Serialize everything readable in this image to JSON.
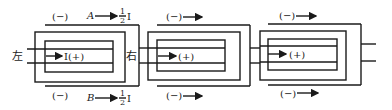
{
  "diagram": {
    "type": "current-flow-schematic",
    "units": 3,
    "labels": {
      "left": "左",
      "right": "右",
      "inner_current": "I(+)",
      "inner_sign": "(+)",
      "outer_sign": "(−)",
      "top_branch": "A",
      "bottom_branch": "B",
      "half_current_num": "1",
      "half_current_den": "2",
      "half_current_sym": "I"
    },
    "colors": {
      "line": "#1a1a1a",
      "background": "#ffffff"
    }
  }
}
